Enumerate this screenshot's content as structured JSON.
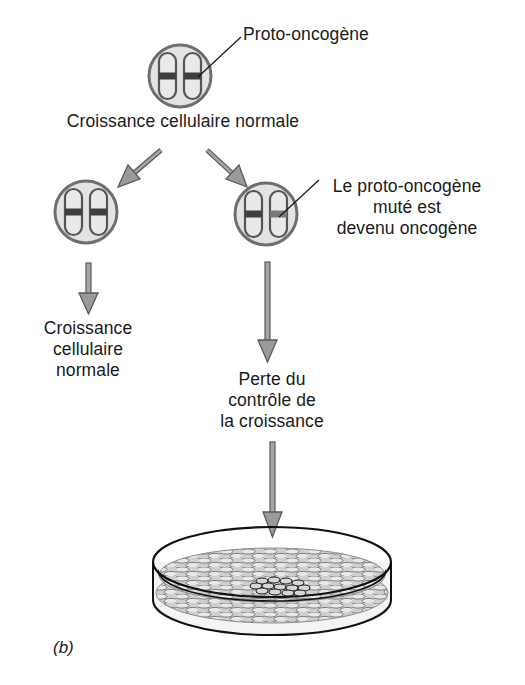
{
  "figure": {
    "panel_label": "(b)",
    "colors": {
      "cell_fill": "#e3e3e3",
      "cell_stroke": "#6f6f6f",
      "chromosome_stroke": "#555555",
      "band_normal": "#3f3f3f",
      "band_mutated": "#7a7a7a",
      "arrow_fill": "#9a9a9a",
      "arrow_stroke": "#5a5a5a",
      "dish_stroke": "#111111",
      "cell_layer": "#8c8c8c",
      "tumor_cells": "#222222"
    }
  },
  "top_cell": {
    "callout": "Proto-oncogène",
    "caption": "Croissance cellulaire normale"
  },
  "left_branch": {
    "outcome_lines": [
      "Croissance",
      "cellulaire",
      "normale"
    ]
  },
  "right_branch": {
    "callout_lines": [
      "Le proto-oncogène",
      "muté est",
      "devenu oncogène"
    ],
    "outcome_lines": [
      "Perte du",
      "contrôle de",
      "la croissance"
    ]
  },
  "dish": {
    "description": "Boîte de culture avec foyer de cellules transformées"
  }
}
